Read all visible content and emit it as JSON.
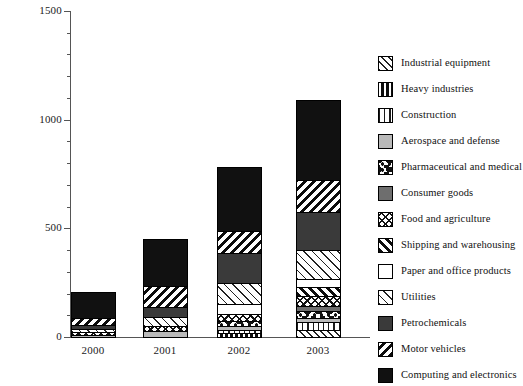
{
  "chart_data": {
    "type": "bar",
    "subtype": "stacked-bar",
    "title": "",
    "xlabel": "",
    "ylabel": "",
    "categories": [
      "2000",
      "2001",
      "2002",
      "2003"
    ],
    "ylim": [
      0,
      1500
    ],
    "yticks": [
      0,
      500,
      1000,
      1500
    ],
    "ytick_labels": [
      "0",
      "500",
      "1000",
      "1500"
    ],
    "yticks_minor": [
      100,
      200,
      300,
      400,
      600,
      700,
      800,
      900,
      1100,
      1200,
      1300,
      1400
    ],
    "grid": false,
    "legend_position": "right",
    "series": [
      {
        "name": "Industrial equipment",
        "pattern": "diagonal-hatch-medium",
        "values": [
          0,
          0,
          0,
          38
        ]
      },
      {
        "name": "Heavy industries",
        "pattern": "vertical-thick-bands",
        "values": [
          0,
          0,
          22,
          0
        ]
      },
      {
        "name": "Construction",
        "pattern": "vertical-lines",
        "values": [
          0,
          0,
          18,
          40
        ]
      },
      {
        "name": "Aerospace and defense",
        "pattern": "solid-light-gray",
        "values": [
          12,
          34,
          24,
          24
        ]
      },
      {
        "name": "Pharmaceutical and medical",
        "pattern": "speckled-dots",
        "values": [
          0,
          0,
          30,
          38
        ]
      },
      {
        "name": "Consumer goods",
        "pattern": "solid-medium-gray",
        "values": [
          0,
          0,
          0,
          26
        ]
      },
      {
        "name": "Food and agriculture",
        "pattern": "crosshatch",
        "values": [
          22,
          24,
          34,
          50
        ]
      },
      {
        "name": "Shipping and warehousing",
        "pattern": "diagonal-thick-forward",
        "values": [
          0,
          0,
          0,
          48
        ]
      },
      {
        "name": "Paper and office products",
        "pattern": "white",
        "values": [
          0,
          0,
          52,
          40
        ]
      },
      {
        "name": "Utilities",
        "pattern": "diagonal-hatch-light",
        "values": [
          16,
          46,
          100,
          136
        ]
      },
      {
        "name": "Petrochemicals",
        "pattern": "solid-dark-gray",
        "values": [
          24,
          54,
          142,
          180
        ]
      },
      {
        "name": "Motor vehicles",
        "pattern": "diagonal-thick-backward",
        "values": [
          36,
          100,
          106,
          152
        ]
      },
      {
        "name": "Computing and electronics",
        "pattern": "solid-black",
        "values": [
          125,
          220,
          300,
          375
        ]
      }
    ],
    "totals": [
      235,
      478,
      828,
      1307
    ]
  },
  "axes": {
    "y_tick_labels": [
      "1500",
      "1000",
      "500",
      "0"
    ],
    "x_tick_labels": [
      "2000",
      "2001",
      "2002",
      "2003"
    ]
  },
  "legend": {
    "items": [
      {
        "label": "Industrial equipment",
        "swatch": "diagonal-hatch-medium"
      },
      {
        "label": "Heavy industries",
        "swatch": "vertical-thick-bands"
      },
      {
        "label": "Construction",
        "swatch": "vertical-lines"
      },
      {
        "label": "Aerospace and defense",
        "swatch": "solid-light-gray"
      },
      {
        "label": "Pharmaceutical and medical",
        "swatch": "speckled-dots"
      },
      {
        "label": "Consumer goods",
        "swatch": "solid-medium-gray"
      },
      {
        "label": "Food and agriculture",
        "swatch": "crosshatch"
      },
      {
        "label": "Shipping and warehousing",
        "swatch": "diagonal-thick-forward"
      },
      {
        "label": "Paper and office products",
        "swatch": "white"
      },
      {
        "label": "Utilities",
        "swatch": "diagonal-hatch-light"
      },
      {
        "label": "Petrochemicals",
        "swatch": "solid-dark-gray"
      },
      {
        "label": "Motor vehicles",
        "swatch": "diagonal-thick-backward"
      },
      {
        "label": "Computing and electronics",
        "swatch": "solid-black"
      }
    ]
  },
  "colors": {
    "axis": "#555555",
    "text": "#1a1a1a",
    "black": "#111111",
    "dark_gray": "#3a3a3a",
    "medium_gray": "#6e6e6e",
    "light_gray": "#b9b9b9",
    "white": "#ffffff"
  }
}
